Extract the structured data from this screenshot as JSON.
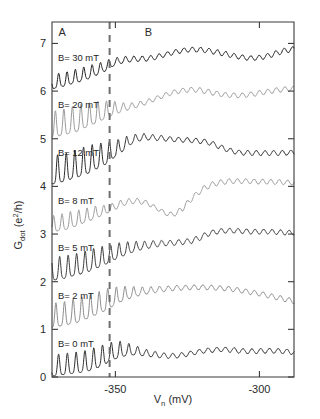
{
  "chart_data": {
    "type": "line",
    "title": "",
    "xlabel": "V_n (mV)",
    "xlabel_main": "V",
    "xlabel_sub": "n",
    "xlabel_unit": " (mV)",
    "ylabel": "G_dot (e^2/h)",
    "ylabel_main": "G",
    "ylabel_sub": "dot",
    "ylabel_unit_open": " (e",
    "ylabel_sup": "2",
    "ylabel_unit_close": "/h)",
    "xlim": [
      -372,
      -288
    ],
    "ylim": [
      0,
      7.45
    ],
    "xticks": [
      -350,
      -300
    ],
    "xtick_labels": [
      "-350",
      "-300"
    ],
    "yticks": [
      0,
      1,
      2,
      3,
      4,
      5,
      6,
      7
    ],
    "ytick_labels": [
      "0",
      "1",
      "2",
      "3",
      "4",
      "5",
      "6",
      "7"
    ],
    "grid": false,
    "legend_position": "inline-left",
    "annotations": [
      {
        "name": "region-a",
        "text": "A",
        "x": -368.5,
        "y": 7.15
      },
      {
        "name": "region-b",
        "text": "B",
        "x": -338.5,
        "y": 7.15
      }
    ],
    "vline": {
      "x": -352.0,
      "style": "dashed",
      "color": "#6e6e6e"
    },
    "series": [
      {
        "name": "B= 0 mT",
        "label": "B= 0 mT",
        "field_mT": 0,
        "offset": 0,
        "color": "#2d2d2d",
        "osc_amp": 0.4,
        "osc_period": 3.05,
        "osc_phase": 0.25,
        "osc_decay_x": -346,
        "osc_decay_k": 0.3,
        "baseline": [
          [
            -372,
            0.02
          ],
          [
            -368,
            0.05
          ],
          [
            -364,
            0.08
          ],
          [
            -360,
            0.12
          ],
          [
            -357,
            0.18
          ],
          [
            -354,
            0.26
          ],
          [
            -352,
            0.33
          ],
          [
            -350,
            0.38
          ],
          [
            -348,
            0.42
          ],
          [
            -346,
            0.45
          ],
          [
            -343,
            0.46
          ],
          [
            -340,
            0.44
          ],
          [
            -337,
            0.42
          ],
          [
            -334,
            0.4
          ],
          [
            -331,
            0.39
          ],
          [
            -328,
            0.4
          ],
          [
            -325,
            0.43
          ],
          [
            -322,
            0.47
          ],
          [
            -319,
            0.5
          ],
          [
            -316,
            0.52
          ],
          [
            -313,
            0.53
          ],
          [
            -310,
            0.52
          ],
          [
            -307,
            0.5
          ],
          [
            -304,
            0.49
          ],
          [
            -301,
            0.49
          ],
          [
            -298,
            0.5
          ],
          [
            -295,
            0.5
          ],
          [
            -292,
            0.49
          ],
          [
            -288,
            0.47
          ]
        ]
      },
      {
        "name": "B= 2 mT",
        "label": "B= 2 mT",
        "field_mT": 2,
        "offset": 1,
        "color": "#8c8c8c",
        "osc_amp": 0.46,
        "osc_period": 3.0,
        "osc_phase": 0.55,
        "osc_decay_x": -347,
        "osc_decay_k": 0.24,
        "baseline": [
          [
            -372,
            0.04
          ],
          [
            -368,
            0.08
          ],
          [
            -364,
            0.14
          ],
          [
            -360,
            0.22
          ],
          [
            -357,
            0.3
          ],
          [
            -354,
            0.38
          ],
          [
            -352,
            0.45
          ],
          [
            -350,
            0.52
          ],
          [
            -348,
            0.58
          ],
          [
            -345,
            0.65
          ],
          [
            -342,
            0.7
          ],
          [
            -339,
            0.74
          ],
          [
            -336,
            0.77
          ],
          [
            -333,
            0.79
          ],
          [
            -330,
            0.81
          ],
          [
            -327,
            0.82
          ],
          [
            -324,
            0.83
          ],
          [
            -321,
            0.83
          ],
          [
            -318,
            0.83
          ],
          [
            -315,
            0.82
          ],
          [
            -312,
            0.81
          ],
          [
            -309,
            0.79
          ],
          [
            -306,
            0.76
          ],
          [
            -303,
            0.73
          ],
          [
            -300,
            0.7
          ],
          [
            -297,
            0.66
          ],
          [
            -294,
            0.62
          ],
          [
            -291,
            0.58
          ],
          [
            -288,
            0.54
          ]
        ]
      },
      {
        "name": "B= 5 mT",
        "label": "B= 5 mT",
        "field_mT": 5,
        "offset": 2,
        "color": "#3b3b3b",
        "osc_amp": 0.43,
        "osc_period": 2.95,
        "osc_phase": 0.1,
        "osc_decay_x": -348,
        "osc_decay_k": 0.2,
        "baseline": [
          [
            -372,
            0.03
          ],
          [
            -368,
            0.07
          ],
          [
            -364,
            0.13
          ],
          [
            -360,
            0.2
          ],
          [
            -357,
            0.28
          ],
          [
            -354,
            0.35
          ],
          [
            -352,
            0.41
          ],
          [
            -350,
            0.47
          ],
          [
            -348,
            0.53
          ],
          [
            -345,
            0.6
          ],
          [
            -342,
            0.66
          ],
          [
            -339,
            0.7
          ],
          [
            -336,
            0.73
          ],
          [
            -333,
            0.75
          ],
          [
            -330,
            0.76
          ],
          [
            -327,
            0.78
          ],
          [
            -324,
            0.8
          ],
          [
            -321,
            0.86
          ],
          [
            -318,
            0.95
          ],
          [
            -315,
            1.0
          ],
          [
            -312,
            1.02
          ],
          [
            -309,
            1.02
          ],
          [
            -306,
            1.01
          ],
          [
            -303,
            1.0
          ],
          [
            -300,
            1.0
          ],
          [
            -297,
            1.0
          ],
          [
            -294,
            0.99
          ],
          [
            -291,
            0.98
          ],
          [
            -288,
            0.98
          ]
        ]
      },
      {
        "name": "B= 8 mT",
        "label": "B= 8 mT",
        "field_mT": 8,
        "offset": 3,
        "color": "#9a9a9a",
        "osc_amp": 0.3,
        "osc_period": 2.9,
        "osc_phase": 0.8,
        "osc_decay_x": -355,
        "osc_decay_k": 0.3,
        "baseline": [
          [
            -372,
            0.04
          ],
          [
            -368,
            0.09
          ],
          [
            -364,
            0.16
          ],
          [
            -360,
            0.25
          ],
          [
            -357,
            0.33
          ],
          [
            -354,
            0.4
          ],
          [
            -352,
            0.46
          ],
          [
            -350,
            0.52
          ],
          [
            -348,
            0.58
          ],
          [
            -345,
            0.63
          ],
          [
            -342,
            0.64
          ],
          [
            -339,
            0.6
          ],
          [
            -336,
            0.5
          ],
          [
            -333,
            0.4
          ],
          [
            -331,
            0.36
          ],
          [
            -329,
            0.38
          ],
          [
            -327,
            0.47
          ],
          [
            -325,
            0.6
          ],
          [
            -322,
            0.78
          ],
          [
            -319,
            0.92
          ],
          [
            -316,
            1.0
          ],
          [
            -313,
            1.04
          ],
          [
            -310,
            1.06
          ],
          [
            -307,
            1.06
          ],
          [
            -304,
            1.06
          ],
          [
            -301,
            1.05
          ],
          [
            -298,
            1.05
          ],
          [
            -294,
            1.04
          ],
          [
            -288,
            1.03
          ]
        ]
      },
      {
        "name": "B= 12 mT",
        "label": "B= 12 mT",
        "field_mT": 12,
        "offset": 4,
        "color": "#2a2a2a",
        "osc_amp": 0.55,
        "osc_period": 3.0,
        "osc_phase": 0.35,
        "osc_decay_x": -350,
        "osc_decay_k": 0.26,
        "baseline": [
          [
            -372,
            0.05
          ],
          [
            -368,
            0.1
          ],
          [
            -364,
            0.18
          ],
          [
            -360,
            0.27
          ],
          [
            -357,
            0.36
          ],
          [
            -354,
            0.45
          ],
          [
            -352,
            0.53
          ],
          [
            -350,
            0.62
          ],
          [
            -348,
            0.72
          ],
          [
            -346,
            0.82
          ],
          [
            -344,
            0.9
          ],
          [
            -342,
            0.95
          ],
          [
            -340,
            0.97
          ],
          [
            -337,
            0.97
          ],
          [
            -334,
            0.96
          ],
          [
            -331,
            0.94
          ],
          [
            -328,
            0.93
          ],
          [
            -325,
            0.92
          ],
          [
            -322,
            0.91
          ],
          [
            -319,
            0.89
          ],
          [
            -316,
            0.84
          ],
          [
            -313,
            0.76
          ],
          [
            -310,
            0.7
          ],
          [
            -307,
            0.66
          ],
          [
            -304,
            0.65
          ],
          [
            -301,
            0.65
          ],
          [
            -298,
            0.65
          ],
          [
            -294,
            0.65
          ],
          [
            -288,
            0.66
          ]
        ]
      },
      {
        "name": "B= 20 mT",
        "label": "B= 20 mT",
        "field_mT": 20,
        "offset": 5,
        "color": "#9a9a9a",
        "osc_amp": 0.5,
        "osc_period": 2.95,
        "osc_phase": 0.6,
        "osc_decay_x": -352,
        "osc_decay_k": 0.3,
        "baseline": [
          [
            -372,
            0.03
          ],
          [
            -368,
            0.08
          ],
          [
            -364,
            0.15
          ],
          [
            -360,
            0.24
          ],
          [
            -357,
            0.32
          ],
          [
            -354,
            0.4
          ],
          [
            -352,
            0.47
          ],
          [
            -350,
            0.52
          ],
          [
            -348,
            0.56
          ],
          [
            -345,
            0.61
          ],
          [
            -342,
            0.66
          ],
          [
            -339,
            0.72
          ],
          [
            -336,
            0.79
          ],
          [
            -333,
            0.86
          ],
          [
            -330,
            0.92
          ],
          [
            -327,
            0.96
          ],
          [
            -324,
            0.98
          ],
          [
            -321,
            0.97
          ],
          [
            -318,
            0.94
          ],
          [
            -315,
            0.9
          ],
          [
            -312,
            0.87
          ],
          [
            -309,
            0.86
          ],
          [
            -306,
            0.86
          ],
          [
            -303,
            0.88
          ],
          [
            -300,
            0.91
          ],
          [
            -297,
            0.94
          ],
          [
            -294,
            0.97
          ],
          [
            -291,
            0.99
          ],
          [
            -288,
            1.0
          ]
        ]
      },
      {
        "name": "B= 30 mT",
        "label": "B= 30 mT",
        "field_mT": 30,
        "offset": 6,
        "color": "#1a1a1a",
        "osc_amp": 0.26,
        "osc_period": 2.9,
        "osc_phase": 0.2,
        "osc_decay_x": -354,
        "osc_decay_k": 0.22,
        "baseline": [
          [
            -372,
            0.05
          ],
          [
            -368,
            0.1
          ],
          [
            -364,
            0.17
          ],
          [
            -360,
            0.25
          ],
          [
            -357,
            0.33
          ],
          [
            -354,
            0.41
          ],
          [
            -352,
            0.48
          ],
          [
            -350,
            0.54
          ],
          [
            -348,
            0.58
          ],
          [
            -345,
            0.61
          ],
          [
            -342,
            0.62
          ],
          [
            -339,
            0.63
          ],
          [
            -336,
            0.66
          ],
          [
            -333,
            0.71
          ],
          [
            -330,
            0.76
          ],
          [
            -327,
            0.8
          ],
          [
            -324,
            0.82
          ],
          [
            -321,
            0.82
          ],
          [
            -318,
            0.8
          ],
          [
            -315,
            0.77
          ],
          [
            -312,
            0.73
          ],
          [
            -309,
            0.69
          ],
          [
            -306,
            0.66
          ],
          [
            -303,
            0.64
          ],
          [
            -300,
            0.65
          ],
          [
            -297,
            0.69
          ],
          [
            -294,
            0.75
          ],
          [
            -291,
            0.8
          ],
          [
            -288,
            0.83
          ]
        ]
      }
    ]
  }
}
